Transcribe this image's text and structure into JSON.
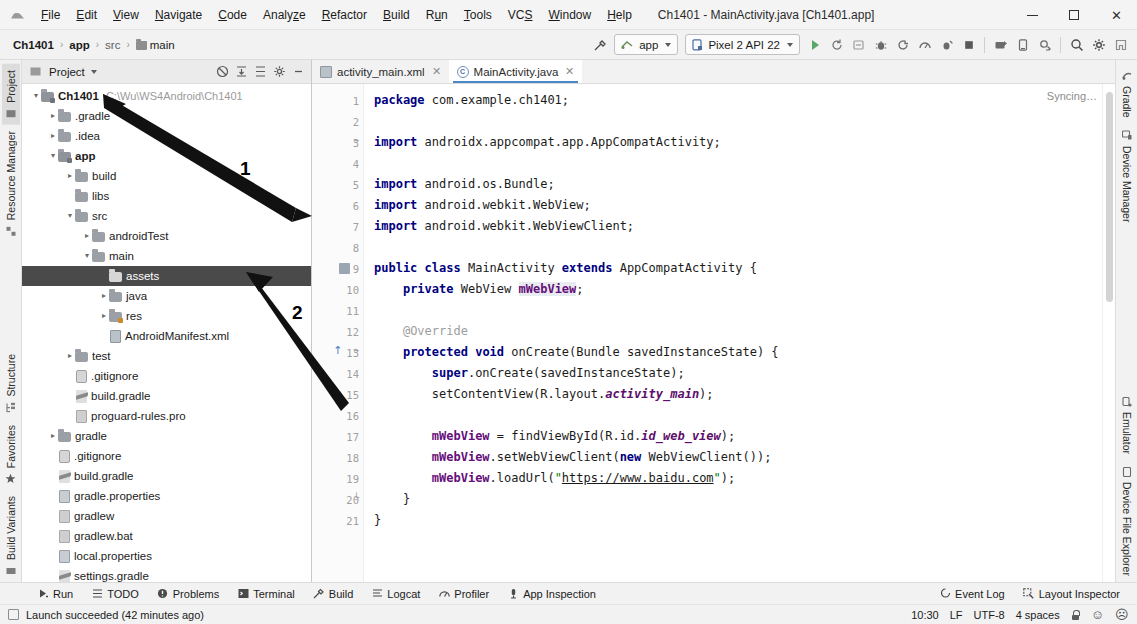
{
  "window": {
    "title": "Ch1401 - MainActivity.java [Ch1401.app]",
    "minimize_label": "–",
    "maximize_label": "❐",
    "close_label": "✕"
  },
  "menubar": {
    "items": [
      {
        "label": "File",
        "mnemonic": "F"
      },
      {
        "label": "Edit",
        "mnemonic": "E"
      },
      {
        "label": "View",
        "mnemonic": "V"
      },
      {
        "label": "Navigate",
        "mnemonic": "N"
      },
      {
        "label": "Code",
        "mnemonic": "C"
      },
      {
        "label": "Analyze",
        "mnemonic": "z"
      },
      {
        "label": "Refactor",
        "mnemonic": "R"
      },
      {
        "label": "Build",
        "mnemonic": "B"
      },
      {
        "label": "Run",
        "mnemonic": "u"
      },
      {
        "label": "Tools",
        "mnemonic": "T"
      },
      {
        "label": "VCS",
        "mnemonic": "S"
      },
      {
        "label": "Window",
        "mnemonic": "W"
      },
      {
        "label": "Help",
        "mnemonic": "H"
      }
    ]
  },
  "navbar": {
    "breadcrumbs": [
      {
        "label": "Ch1401",
        "bold": true,
        "folder": false
      },
      {
        "label": "app",
        "bold": true,
        "folder": false
      },
      {
        "label": "src",
        "bold": false,
        "folder": false
      },
      {
        "label": "main",
        "bold": false,
        "folder": true
      }
    ],
    "separator": "›",
    "run_config": "app",
    "device": "Pixel 2 API 22",
    "icons": [
      "build-hammer-icon",
      "run-icon",
      "debug-rerun-icon",
      "apply-changes-icon",
      "debug-bug-icon",
      "run-coverage-icon",
      "profile-icon",
      "attach-debugger-icon",
      "stop-icon",
      "avd-manager-icon",
      "sdk-manager-icon",
      "sync-gradle-icon",
      "search-icon",
      "settings-gear-icon",
      "project-structure-icon"
    ]
  },
  "left_rail": {
    "items": [
      {
        "label": "Project",
        "icon": "project-icon",
        "active": true
      },
      {
        "label": "Resource Manager",
        "icon": "resource-manager-icon",
        "active": false
      },
      {
        "label": "Structure",
        "icon": "structure-icon",
        "active": false
      },
      {
        "label": "Favorites",
        "icon": "star-icon",
        "active": false
      },
      {
        "label": "Build Variants",
        "icon": "build-variants-icon",
        "active": false
      }
    ]
  },
  "right_rail": {
    "top_items": [
      {
        "label": "Gradle",
        "icon": "gradle-icon"
      },
      {
        "label": "Device Manager",
        "icon": "device-manager-icon"
      }
    ],
    "bottom_items": [
      {
        "label": "Emulator",
        "icon": "emulator-icon"
      },
      {
        "label": "Device File Explorer",
        "icon": "device-file-explorer-icon"
      }
    ]
  },
  "project_panel": {
    "title": "Project",
    "dropdown_caret": "▾",
    "tools": [
      {
        "name": "collapse-scope-icon",
        "glyph": "⊗"
      },
      {
        "name": "expand-all-icon",
        "glyph": "⧉"
      },
      {
        "name": "collapse-all-icon",
        "glyph": "≡"
      },
      {
        "name": "settings-gear-icon",
        "glyph": "⚙"
      },
      {
        "name": "hide-panel-icon",
        "glyph": "−"
      }
    ],
    "tree": [
      {
        "indent": 0,
        "arrow": "⌄",
        "icon": "module-folder-icon",
        "label": "Ch1401",
        "bold": true,
        "path": "C:\\Wu\\WS4Android\\Ch1401",
        "selected": false
      },
      {
        "indent": 1,
        "arrow": "›",
        "icon": "folder-icon",
        "label": ".gradle",
        "bold": false,
        "path": "",
        "selected": false
      },
      {
        "indent": 1,
        "arrow": "›",
        "icon": "folder-icon",
        "label": ".idea",
        "bold": false,
        "path": "",
        "selected": false
      },
      {
        "indent": 1,
        "arrow": "⌄",
        "icon": "module-folder-icon",
        "label": "app",
        "bold": true,
        "path": "",
        "selected": false
      },
      {
        "indent": 2,
        "arrow": "›",
        "icon": "folder-icon",
        "label": "build",
        "bold": false,
        "path": "",
        "selected": false
      },
      {
        "indent": 2,
        "arrow": "",
        "icon": "folder-icon",
        "label": "libs",
        "bold": false,
        "path": "",
        "selected": false
      },
      {
        "indent": 2,
        "arrow": "⌄",
        "icon": "folder-icon",
        "label": "src",
        "bold": false,
        "path": "",
        "selected": false
      },
      {
        "indent": 3,
        "arrow": "›",
        "icon": "folder-icon",
        "label": "androidTest",
        "bold": false,
        "path": "",
        "selected": false
      },
      {
        "indent": 3,
        "arrow": "⌄",
        "icon": "folder-icon",
        "label": "main",
        "bold": false,
        "path": "",
        "selected": false
      },
      {
        "indent": 4,
        "arrow": "",
        "icon": "folder-icon",
        "label": "assets",
        "bold": false,
        "path": "",
        "selected": true
      },
      {
        "indent": 4,
        "arrow": "›",
        "icon": "folder-icon",
        "label": "java",
        "bold": false,
        "path": "",
        "selected": false
      },
      {
        "indent": 4,
        "arrow": "›",
        "icon": "res-folder-icon",
        "label": "res",
        "bold": false,
        "path": "",
        "selected": false
      },
      {
        "indent": 4,
        "arrow": "",
        "icon": "xml-file-icon",
        "label": "AndroidManifest.xml",
        "bold": false,
        "path": "",
        "selected": false
      },
      {
        "indent": 2,
        "arrow": "›",
        "icon": "folder-icon",
        "label": "test",
        "bold": false,
        "path": "",
        "selected": false
      },
      {
        "indent": 2,
        "arrow": "",
        "icon": "git-file-icon",
        "label": ".gitignore",
        "bold": false,
        "path": "",
        "selected": false
      },
      {
        "indent": 2,
        "arrow": "",
        "icon": "gradle-file-icon",
        "label": "build.gradle",
        "bold": false,
        "path": "",
        "selected": false
      },
      {
        "indent": 2,
        "arrow": "",
        "icon": "file-icon",
        "label": "proguard-rules.pro",
        "bold": false,
        "path": "",
        "selected": false
      },
      {
        "indent": 1,
        "arrow": "›",
        "icon": "folder-icon",
        "label": "gradle",
        "bold": false,
        "path": "",
        "selected": false
      },
      {
        "indent": 1,
        "arrow": "",
        "icon": "git-file-icon",
        "label": ".gitignore",
        "bold": false,
        "path": "",
        "selected": false
      },
      {
        "indent": 1,
        "arrow": "",
        "icon": "gradle-file-icon",
        "label": "build.gradle",
        "bold": false,
        "path": "",
        "selected": false
      },
      {
        "indent": 1,
        "arrow": "",
        "icon": "properties-file-icon",
        "label": "gradle.properties",
        "bold": false,
        "path": "",
        "selected": false
      },
      {
        "indent": 1,
        "arrow": "",
        "icon": "file-icon",
        "label": "gradlew",
        "bold": false,
        "path": "",
        "selected": false
      },
      {
        "indent": 1,
        "arrow": "",
        "icon": "file-icon",
        "label": "gradlew.bat",
        "bold": false,
        "path": "",
        "selected": false
      },
      {
        "indent": 1,
        "arrow": "",
        "icon": "properties-file-icon",
        "label": "local.properties",
        "bold": false,
        "path": "",
        "selected": false
      },
      {
        "indent": 1,
        "arrow": "",
        "icon": "gradle-file-icon",
        "label": "settings.gradle",
        "bold": false,
        "path": "",
        "selected": false
      },
      {
        "indent": 0,
        "arrow": "›",
        "icon": "library-icon",
        "label": "External Libraries",
        "bold": false,
        "path": "",
        "selected": false
      },
      {
        "indent": 0,
        "arrow": "",
        "icon": "scratch-icon",
        "label": "Scratches and Consoles",
        "bold": false,
        "path": "",
        "selected": false
      }
    ]
  },
  "editor": {
    "tabs": [
      {
        "label": "activity_main.xml",
        "icon": "xml-file-icon",
        "active": false,
        "close": "✕"
      },
      {
        "label": "MainActivity.java",
        "icon": "java-class-icon",
        "active": true,
        "close": "✕"
      }
    ],
    "status_text": "Syncing…",
    "lines": [
      {
        "n": "1",
        "marker": "",
        "fold": "",
        "html": "<span class=\"kw\">package</span> com.example.ch1401;"
      },
      {
        "n": "2",
        "marker": "",
        "fold": "",
        "html": ""
      },
      {
        "n": "3",
        "marker": "",
        "fold": "⌄",
        "html": "<span class=\"kw\">import</span> androidx.appcompat.app.AppCompatActivity;"
      },
      {
        "n": "4",
        "marker": "",
        "fold": "",
        "html": ""
      },
      {
        "n": "5",
        "marker": "",
        "fold": "",
        "html": "<span class=\"kw\">import</span> android.os.Bundle;"
      },
      {
        "n": "6",
        "marker": "",
        "fold": "",
        "html": "<span class=\"kw\">import</span> android.webkit.WebView;"
      },
      {
        "n": "7",
        "marker": "",
        "fold": "",
        "html": "<span class=\"kw\">import</span> android.webkit.WebViewClient;"
      },
      {
        "n": "8",
        "marker": "",
        "fold": "",
        "html": ""
      },
      {
        "n": "9",
        "marker": "cls",
        "fold": "",
        "html": "<span class=\"kw\">public class</span> MainActivity <span class=\"kw\">extends</span> AppCompatActivity {"
      },
      {
        "n": "10",
        "marker": "",
        "fold": "",
        "html": "    <span class=\"kw\">private</span> WebView <span class=\"fld hl\">mWebView</span>;"
      },
      {
        "n": "11",
        "marker": "",
        "fold": "",
        "html": ""
      },
      {
        "n": "12",
        "marker": "",
        "fold": "",
        "html": "    <span class=\"ann\">@Override</span>"
      },
      {
        "n": "13",
        "marker": "ovr",
        "fold": "⌄",
        "html": "    <span class=\"kw\">protected void</span> onCreate(Bundle savedInstanceState) {"
      },
      {
        "n": "14",
        "marker": "",
        "fold": "",
        "html": "        <span class=\"kw\">super</span>.onCreate(savedInstanceState);"
      },
      {
        "n": "15",
        "marker": "",
        "fold": "",
        "html": "        setContentView(R.layout.<span class=\"stat\">activity_main</span>);"
      },
      {
        "n": "16",
        "marker": "",
        "fold": "",
        "html": ""
      },
      {
        "n": "17",
        "marker": "",
        "fold": "",
        "html": "        <span class=\"fld\">mWebView</span> = findViewById(R.id.<span class=\"stat\">id_web_view</span>);"
      },
      {
        "n": "18",
        "marker": "",
        "fold": "",
        "html": "        <span class=\"fld\">mWebView</span>.setWebViewClient(<span class=\"kw\">new</span> WebViewClient());"
      },
      {
        "n": "19",
        "marker": "",
        "fold": "",
        "html": "        <span class=\"fld\">mWebView</span>.loadUrl(<span class=\"str\">\"</span><span class=\"str url\">https://www.baidu.com</span><span class=\"str\">\"</span>);"
      },
      {
        "n": "20",
        "marker": "",
        "fold": "⌃",
        "html": "    }"
      },
      {
        "n": "21",
        "marker": "",
        "fold": "",
        "html": "}"
      }
    ]
  },
  "bottom_toolbar": {
    "left_items": [
      {
        "label": "Run",
        "icon": "run-icon"
      },
      {
        "label": "TODO",
        "icon": "todo-icon"
      },
      {
        "label": "Problems",
        "icon": "problems-icon"
      },
      {
        "label": "Terminal",
        "icon": "terminal-icon"
      },
      {
        "label": "Build",
        "icon": "build-hammer-icon"
      },
      {
        "label": "Logcat",
        "icon": "logcat-icon"
      },
      {
        "label": "Profiler",
        "icon": "profiler-icon"
      },
      {
        "label": "App Inspection",
        "icon": "app-inspection-icon"
      }
    ],
    "right_items": [
      {
        "label": "Event Log",
        "icon": "event-log-icon"
      },
      {
        "label": "Layout Inspector",
        "icon": "layout-inspector-icon"
      }
    ]
  },
  "status_bar": {
    "message": "Launch succeeded (42 minutes ago)",
    "right_items": [
      {
        "name": "caret-position",
        "label": "10:30"
      },
      {
        "name": "line-separator",
        "label": "LF"
      },
      {
        "name": "file-encoding",
        "label": "UTF-8"
      },
      {
        "name": "indent-setting",
        "label": "4 spaces"
      }
    ],
    "lock_icon": "read-only-lock-icon",
    "happy_icon": "☺",
    "sad_icon": "☹"
  },
  "annotations": [
    {
      "label": "1"
    },
    {
      "label": "2"
    }
  ],
  "colors": {
    "accent": "#4a86c8",
    "selection": "#4a4a4a",
    "keyword": "#000080",
    "string": "#008000",
    "field": "#660e7a",
    "panel_bg": "#f2f2f2"
  }
}
